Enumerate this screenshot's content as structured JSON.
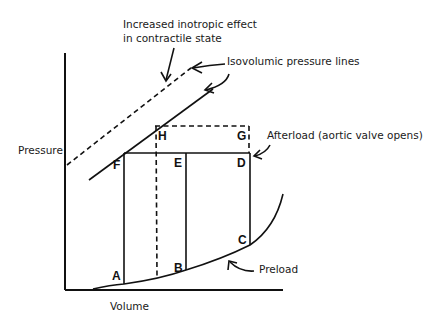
{
  "diagram": {
    "axes": {
      "y_label": "Pressure",
      "x_label": "Volume"
    },
    "annotations": {
      "inotropic_line1": "Increased inotropic effect",
      "inotropic_line2": "in contractile state",
      "isovolumic": "Isovolumic pressure lines",
      "afterload": "Afterload (aortic valve opens)",
      "preload": "Preload"
    },
    "points": {
      "A": "A",
      "B": "B",
      "C": "C",
      "D": "D",
      "E": "E",
      "F": "F",
      "G": "G",
      "H": "H"
    },
    "colors": {
      "line": "#111111",
      "background": "#ffffff"
    }
  }
}
